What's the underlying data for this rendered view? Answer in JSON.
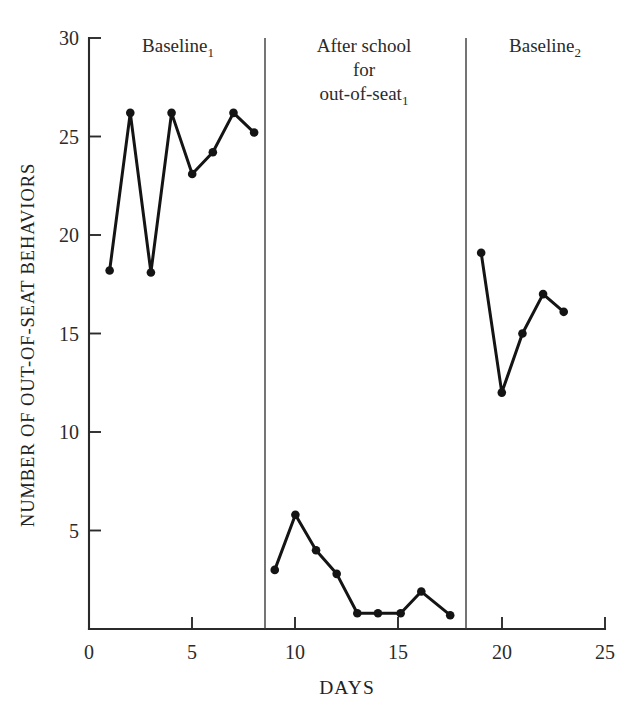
{
  "chart_data": {
    "type": "line",
    "title": "",
    "xlabel": "DAYS",
    "ylabel": "NUMBER OF OUT-OF-SEAT BEHAVIORS",
    "xlim": [
      0,
      25
    ],
    "ylim": [
      0,
      30
    ],
    "xticks": [
      0,
      5,
      10,
      15,
      20,
      25
    ],
    "xtick_labels": [
      "0",
      "5",
      "10",
      "15",
      "20",
      "25"
    ],
    "yticks": [
      5,
      10,
      15,
      20,
      25,
      30
    ],
    "ytick_labels": [
      "5",
      "10",
      "15",
      "20",
      "25",
      "30"
    ],
    "grid": false,
    "legend": "none",
    "marker": "filled-circle",
    "phases": [
      {
        "name": "baseline-1",
        "label_lines": [
          "Baseline"
        ],
        "label_subscript": "1",
        "x_range": [
          0.0,
          8.5
        ],
        "points": [
          {
            "x": 1,
            "y": 18.2
          },
          {
            "x": 2,
            "y": 26.2
          },
          {
            "x": 3,
            "y": 18.1
          },
          {
            "x": 4,
            "y": 26.2
          },
          {
            "x": 5,
            "y": 23.1
          },
          {
            "x": 6,
            "y": 24.2
          },
          {
            "x": 7,
            "y": 26.2
          },
          {
            "x": 8,
            "y": 25.2
          }
        ]
      },
      {
        "name": "after-school-for-out-of-seat-1",
        "label_lines": [
          "After school",
          "for",
          "out-of-seat"
        ],
        "label_subscript": "1",
        "x_range": [
          8.5,
          18.3
        ],
        "points": [
          {
            "x": 9.0,
            "y": 3.0
          },
          {
            "x": 10.0,
            "y": 5.8
          },
          {
            "x": 11.0,
            "y": 4.0
          },
          {
            "x": 12.0,
            "y": 2.8
          },
          {
            "x": 13.0,
            "y": 0.8
          },
          {
            "x": 14.0,
            "y": 0.8
          },
          {
            "x": 15.1,
            "y": 0.8
          },
          {
            "x": 16.1,
            "y": 1.9
          },
          {
            "x": 17.5,
            "y": 0.7
          }
        ]
      },
      {
        "name": "baseline-2",
        "label_lines": [
          "Baseline"
        ],
        "label_subscript": "2",
        "x_range": [
          18.3,
          25.0
        ],
        "points": [
          {
            "x": 19.0,
            "y": 19.1
          },
          {
            "x": 20.0,
            "y": 12.0
          },
          {
            "x": 21.0,
            "y": 15.0
          },
          {
            "x": 22.0,
            "y": 17.0
          },
          {
            "x": 23.0,
            "y": 16.1
          }
        ]
      }
    ],
    "phase_dividers": [
      8.5,
      18.3
    ],
    "colors": {
      "line": "#141414",
      "marker": "#141414",
      "axis": "#2b2b2b",
      "divider": "#3a3a3a",
      "background": "#ffffff"
    }
  }
}
